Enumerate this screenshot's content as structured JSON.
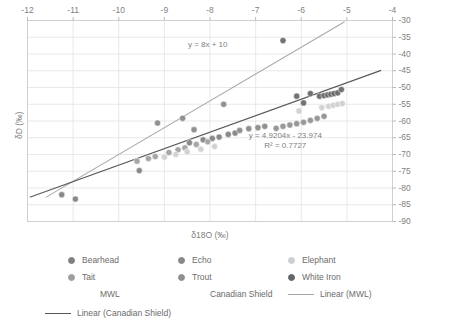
{
  "chart_data": {
    "type": "scatter",
    "title": "",
    "xlabel": "δ18O (‰)",
    "ylabel": "δD (‰)",
    "xlim": [
      -12,
      -4
    ],
    "ylim": [
      -90,
      -30
    ],
    "xticks": [
      -12,
      -11,
      -10,
      -9,
      -8,
      -7,
      -6,
      -5,
      -4
    ],
    "yticks": [
      -30,
      -35,
      -40,
      -45,
      -50,
      -55,
      -60,
      -65,
      -70,
      -75,
      -80,
      -85,
      -90
    ],
    "xtick_labels": [
      "-12",
      "-11",
      "-10",
      "-9",
      "-8",
      "-7",
      "-6",
      "-5",
      "-4"
    ],
    "ytick_labels": [
      "-30",
      "-35",
      "-40",
      "-45",
      "-50",
      "-55",
      "-60",
      "-65",
      "-70",
      "-75",
      "-80",
      "-85",
      "-90"
    ],
    "xaxis_position": "top",
    "yaxis_position": "right",
    "grid": true,
    "legend_position": "bottom",
    "annotations": [
      {
        "text": "y = 8x + 10",
        "x": -8.05,
        "y": -37.2
      },
      {
        "text": "y = 4.9204x - 23.974",
        "x": -6.35,
        "y": -64.4
      },
      {
        "text": "R² = 0.7727",
        "x": -6.35,
        "y": -67.4
      }
    ],
    "series": [
      {
        "name": "Bearhead",
        "color": "#808080",
        "points": [
          [
            -11.25,
            -82.0
          ],
          [
            -10.95,
            -83.3
          ],
          [
            -9.55,
            -74.8
          ],
          [
            -8.45,
            -66.5
          ],
          [
            -8.15,
            -65.6
          ],
          [
            -7.95,
            -65.2
          ],
          [
            -7.8,
            -64.8
          ],
          [
            -7.6,
            -64.0
          ],
          [
            -7.45,
            -63.6
          ]
        ]
      },
      {
        "name": "Tait",
        "color": "#9e9e9e",
        "points": [
          [
            -9.6,
            -72.0
          ],
          [
            -9.35,
            -71.2
          ],
          [
            -9.2,
            -70.6
          ],
          [
            -8.9,
            -69.4
          ],
          [
            -8.7,
            -68.6
          ],
          [
            -8.55,
            -68.0
          ],
          [
            -8.3,
            -67.0
          ],
          [
            -8.05,
            -66.2
          ]
        ]
      },
      {
        "name": "Echo",
        "color": "#888888",
        "points": [
          [
            -9.15,
            -60.6
          ],
          [
            -8.6,
            -59.2
          ],
          [
            -8.35,
            -62.6
          ],
          [
            -7.7,
            -55.0
          ],
          [
            -7.35,
            -62.8
          ],
          [
            -7.15,
            -62.3
          ],
          [
            -6.95,
            -62.0
          ],
          [
            -6.8,
            -61.6
          ]
        ]
      },
      {
        "name": "Trout",
        "color": "#8f8f8f",
        "points": [
          [
            -6.55,
            -62.2
          ],
          [
            -6.4,
            -61.6
          ],
          [
            -6.25,
            -61.2
          ],
          [
            -6.1,
            -60.8
          ],
          [
            -5.95,
            -60.4
          ],
          [
            -5.8,
            -59.8
          ],
          [
            -5.65,
            -59.2
          ],
          [
            -5.5,
            -58.6
          ]
        ]
      },
      {
        "name": "Elephant",
        "color": "#cfcfcf",
        "points": [
          [
            -9.0,
            -70.8
          ],
          [
            -8.75,
            -70.0
          ],
          [
            -8.5,
            -69.2
          ],
          [
            -8.2,
            -68.4
          ],
          [
            -7.9,
            -67.6
          ],
          [
            -6.05,
            -57.0
          ],
          [
            -5.55,
            -56.0
          ],
          [
            -5.4,
            -55.6
          ],
          [
            -5.3,
            -55.3
          ],
          [
            -5.2,
            -55.0
          ],
          [
            -5.1,
            -54.8
          ]
        ]
      },
      {
        "name": "White Iron",
        "color": "#666666",
        "points": [
          [
            -6.4,
            -36.0
          ],
          [
            -6.1,
            -52.6
          ],
          [
            -5.95,
            -54.6
          ],
          [
            -5.8,
            -51.8
          ],
          [
            -5.6,
            -52.6
          ],
          [
            -5.5,
            -52.4
          ],
          [
            -5.42,
            -52.2
          ],
          [
            -5.35,
            -52.0
          ],
          [
            -5.28,
            -51.8
          ],
          [
            -5.2,
            -51.6
          ],
          [
            -5.12,
            -50.6
          ]
        ]
      }
    ],
    "lines": [
      {
        "name": "Linear (MWL)",
        "color": "#aaaaaa",
        "equation": "y = 8x + 10",
        "slope": 8,
        "intercept": 10,
        "x_start": -11.6,
        "x_end": -5.05
      },
      {
        "name": "Linear (Canadian Shield)",
        "color": "#595959",
        "equation": "y = 4.9204x - 23.974",
        "slope": 4.9204,
        "intercept": -23.974,
        "r_squared": 0.7727,
        "x_start": -11.95,
        "x_end": -4.25
      }
    ]
  },
  "legend": {
    "entries": [
      {
        "label": "Bearhead",
        "type": "marker",
        "color": "#808080"
      },
      {
        "label": "Echo",
        "type": "marker",
        "color": "#888888"
      },
      {
        "label": "Elephant",
        "type": "marker",
        "color": "#cfcfcf"
      },
      {
        "label": "Tait",
        "type": "marker",
        "color": "#9e9e9e"
      },
      {
        "label": "Trout",
        "type": "marker",
        "color": "#8f8f8f"
      },
      {
        "label": "White Iron",
        "type": "marker",
        "color": "#666666"
      },
      {
        "label": "MWL",
        "type": "none",
        "color": "transparent"
      },
      {
        "label": "Canadian Shield",
        "type": "none",
        "color": "transparent"
      },
      {
        "label": "Linear (MWL)",
        "type": "line",
        "color": "#a6a6a6"
      },
      {
        "label": "Linear (Canadian Shield)",
        "type": "line",
        "color": "#595959"
      }
    ]
  }
}
